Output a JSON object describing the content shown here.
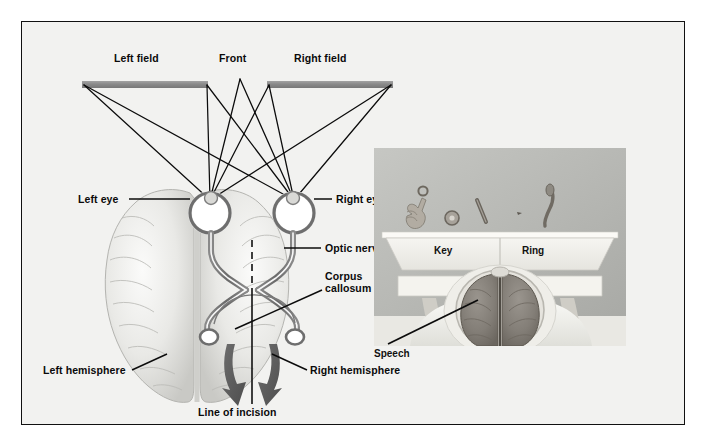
{
  "figure": {
    "background_color": "#f2f2f0",
    "frame_color": "#111111"
  },
  "diagram": {
    "field_bar_color": "#8d8d8d",
    "arrow_color": "#5a5a5a",
    "nerve_color": "#6b6b6b",
    "labels": {
      "left_field": "Left field",
      "front": "Front",
      "right_field": "Right field",
      "left_eye": "Left eye",
      "right_eye": "Right eye",
      "optic_nerve": "Optic nerve",
      "corpus_callosum_line1": "Corpus",
      "corpus_callosum_line2": "callosum",
      "left_hemisphere": "Left hemisphere",
      "right_hemisphere": "Right hemisphere",
      "line_of_incision": "Line of incision"
    }
  },
  "photo": {
    "background_color": "#b9bab6",
    "screen_color": "#f0efea",
    "labels": {
      "key": "Key",
      "ring": "Ring",
      "speech": "Speech"
    },
    "objects": [
      "hand-holding-key-icon",
      "ring-icon",
      "pencil-icon",
      "small-object-icon",
      "spoon-icon"
    ]
  }
}
